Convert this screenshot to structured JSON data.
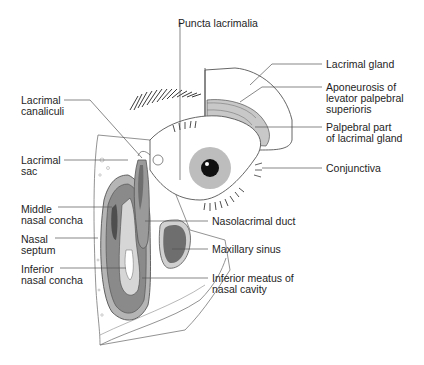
{
  "diagram": {
    "colors": {
      "background": "#ffffff",
      "line": "#555555",
      "dark_fill": "#6e6e6e",
      "mid_fill": "#9a9a9a",
      "light_fill": "#cfcfcf",
      "iris": "#bdbdbd",
      "pupil": "#111111"
    },
    "labels": {
      "puncta_lacrimalia": "Puncta lacrimalia",
      "lacrimal_gland": "Lacrimal gland",
      "aponeurosis": "Aponeurosis of\nlevator palpebral\nsuperioris",
      "palpebral_part": "Palpebral part\nof lacrimal gland",
      "conjunctiva": "Conjunctiva",
      "lacrimal_canaliculi": "Lacrimal\ncanaliculi",
      "lacrimal_sac": "Lacrimal\nsac",
      "middle_nasal_concha": "Middle\nnasal concha",
      "nasal_septum": "Nasal\nseptum",
      "inferior_nasal_concha": "Inferior\nnasal concha",
      "nasolacrimal_duct": "Nasolacrimal duct",
      "maxillary_sinus": "Maxillary sinus",
      "inferior_meatus": "Inferior meatus of\nnasal cavity"
    }
  }
}
